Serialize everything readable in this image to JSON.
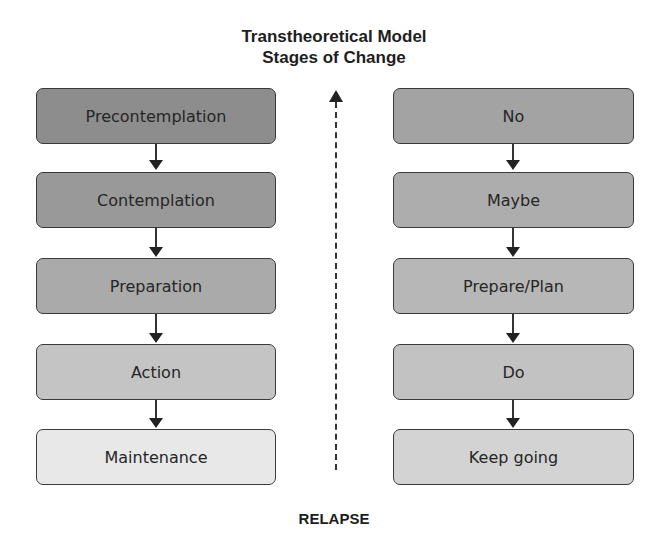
{
  "title": {
    "line1": "Transtheoretical Model",
    "line2": "Stages of Change"
  },
  "left_column": {
    "stages": [
      {
        "label": "Precontemplation",
        "color": "#8d8d8d"
      },
      {
        "label": "Contemplation",
        "color": "#999999"
      },
      {
        "label": "Preparation",
        "color": "#aaaaaa"
      },
      {
        "label": "Action",
        "color": "#c4c4c4"
      },
      {
        "label": "Maintenance",
        "color": "#e8e8e8"
      }
    ]
  },
  "right_column": {
    "stages": [
      {
        "label": "No",
        "color": "#a3a3a3"
      },
      {
        "label": "Maybe",
        "color": "#adadad"
      },
      {
        "label": "Prepare/Plan",
        "color": "#b7b7b7"
      },
      {
        "label": "Do",
        "color": "#c2c2c2"
      },
      {
        "label": "Keep going",
        "color": "#d3d3d3"
      }
    ]
  },
  "relapse_label": "RELAPSE"
}
